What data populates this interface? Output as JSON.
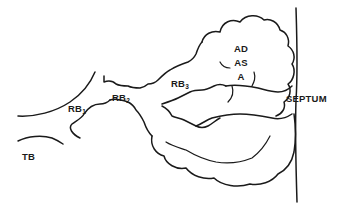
{
  "diagram": {
    "labels": {
      "tb": "TB",
      "rb1": {
        "base": "RB",
        "sub": "1"
      },
      "rb2": {
        "base": "RB",
        "sub": "2"
      },
      "rb3": {
        "base": "RB",
        "sub": "3"
      },
      "ad": "AD",
      "as": "AS",
      "a": "A",
      "septum": "SEPTUM"
    },
    "colors": {
      "line": "#1a1a1a",
      "background": "#ffffff"
    }
  }
}
